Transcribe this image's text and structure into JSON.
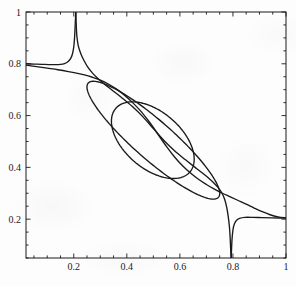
{
  "figure": {
    "background_color": "#fdfdfd",
    "line_color": "#1a1a1a",
    "axis_color": "#1a1a1a"
  },
  "chart_data": {
    "type": "line",
    "title": "",
    "xlabel": "",
    "ylabel": "",
    "xlim": [
      0.02,
      1.0
    ],
    "ylim": [
      0.05,
      1.0
    ],
    "grid": false,
    "legend": null,
    "frame": {
      "left_px": 26,
      "right_px": 286,
      "top_px": 12,
      "bottom_px": 258,
      "box": true,
      "ticks_direction": "in",
      "ticks_on_all_sides": true
    },
    "xticks_major": [
      0.2,
      0.4,
      0.6,
      0.8,
      1.0
    ],
    "xtick_labels": [
      "0.2",
      "0.4",
      "0.6",
      "0.8",
      "1"
    ],
    "xticks_minor_step": 0.05,
    "yticks_major": [
      0.2,
      0.4,
      0.6,
      0.8,
      1.0
    ],
    "ytick_labels": [
      "0.2",
      "0.4",
      "0.6",
      "0.8",
      "1"
    ],
    "yticks_minor_step": 0.05,
    "series": [
      {
        "name": "upper-branch-left",
        "description": "near-horizontal branch entering at left edge near y=0.8, rising into cusp at x=0.205",
        "points": [
          [
            0.02,
            0.8
          ],
          [
            0.05,
            0.799
          ],
          [
            0.08,
            0.798
          ],
          [
            0.105,
            0.797
          ],
          [
            0.13,
            0.797
          ],
          [
            0.15,
            0.798
          ],
          [
            0.165,
            0.801
          ],
          [
            0.178,
            0.808
          ],
          [
            0.188,
            0.82
          ],
          [
            0.195,
            0.838
          ],
          [
            0.2,
            0.865
          ],
          [
            0.203,
            0.9
          ],
          [
            0.205,
            0.94
          ],
          [
            0.2065,
            0.975
          ],
          [
            0.2075,
            1.0
          ]
        ]
      },
      {
        "name": "upper-branch-right",
        "description": "steep descent from top at x=0.208 down through the diagonal",
        "points": [
          [
            0.208,
            1.0
          ],
          [
            0.209,
            0.96
          ],
          [
            0.2105,
            0.925
          ],
          [
            0.2125,
            0.9
          ],
          [
            0.216,
            0.875
          ],
          [
            0.221,
            0.855
          ],
          [
            0.229,
            0.833
          ],
          [
            0.24,
            0.81
          ],
          [
            0.253,
            0.787
          ],
          [
            0.27,
            0.765
          ],
          [
            0.29,
            0.744
          ],
          [
            0.315,
            0.722
          ],
          [
            0.345,
            0.698
          ],
          [
            0.38,
            0.67
          ],
          [
            0.42,
            0.636
          ],
          [
            0.46,
            0.596
          ],
          [
            0.5,
            0.55
          ],
          [
            0.54,
            0.504
          ],
          [
            0.58,
            0.464
          ],
          [
            0.62,
            0.43
          ],
          [
            0.655,
            0.402
          ],
          [
            0.685,
            0.378
          ],
          [
            0.71,
            0.357
          ],
          [
            0.73,
            0.338
          ],
          [
            0.746,
            0.32
          ],
          [
            0.759,
            0.3
          ],
          [
            0.769,
            0.276
          ],
          [
            0.776,
            0.248
          ],
          [
            0.782,
            0.212
          ],
          [
            0.787,
            0.168
          ],
          [
            0.79,
            0.118
          ],
          [
            0.792,
            0.07
          ],
          [
            0.793,
            0.05
          ]
        ]
      },
      {
        "name": "lower-branch-left",
        "description": "diagonal descending curve from left edge near y=0.795 through centre",
        "points": [
          [
            0.02,
            0.795
          ],
          [
            0.06,
            0.789
          ],
          [
            0.1,
            0.783
          ],
          [
            0.14,
            0.777
          ],
          [
            0.18,
            0.77
          ],
          [
            0.21,
            0.764
          ],
          [
            0.24,
            0.757
          ],
          [
            0.27,
            0.748
          ],
          [
            0.3,
            0.737
          ],
          [
            0.33,
            0.722
          ],
          [
            0.36,
            0.703
          ],
          [
            0.39,
            0.68
          ],
          [
            0.42,
            0.652
          ],
          [
            0.45,
            0.62
          ],
          [
            0.48,
            0.582
          ],
          [
            0.5,
            0.554
          ],
          [
            0.52,
            0.524
          ],
          [
            0.55,
            0.48
          ],
          [
            0.58,
            0.44
          ],
          [
            0.61,
            0.406
          ],
          [
            0.64,
            0.378
          ],
          [
            0.67,
            0.354
          ],
          [
            0.7,
            0.334
          ],
          [
            0.73,
            0.316
          ],
          [
            0.76,
            0.3
          ],
          [
            0.79,
            0.286
          ],
          [
            0.82,
            0.272
          ],
          [
            0.85,
            0.258
          ],
          [
            0.88,
            0.243
          ],
          [
            0.91,
            0.229
          ],
          [
            0.94,
            0.217
          ],
          [
            0.97,
            0.209
          ],
          [
            1.0,
            0.205
          ]
        ]
      },
      {
        "name": "lower-branch-right",
        "description": "near-horizontal branch at right edge near y=0.205 falling into cusp at x=0.793",
        "points": [
          [
            0.7935,
            0.05
          ],
          [
            0.795,
            0.09
          ],
          [
            0.797,
            0.128
          ],
          [
            0.8,
            0.158
          ],
          [
            0.805,
            0.18
          ],
          [
            0.813,
            0.195
          ],
          [
            0.825,
            0.203
          ],
          [
            0.845,
            0.207
          ],
          [
            0.875,
            0.207
          ],
          [
            0.91,
            0.206
          ],
          [
            0.95,
            0.205
          ],
          [
            1.0,
            0.204
          ]
        ]
      },
      {
        "name": "outer-ellipse",
        "description": "large elongated lens-shaped ellipse tilted along the descending diagonal",
        "type": "ellipse",
        "center": [
          0.5,
          0.505
        ],
        "semi_major": 0.33,
        "semi_minor": 0.074,
        "rotation_deg": -42
      },
      {
        "name": "inner-ellipse",
        "description": "smaller rounder ellipse tilted along the descending diagonal",
        "type": "ellipse",
        "center": [
          0.498,
          0.505
        ],
        "semi_major": 0.186,
        "semi_minor": 0.108,
        "rotation_deg": -42
      }
    ],
    "annotations": [
      {
        "text": "cusp reaching y=1 at x≈0.206"
      },
      {
        "text": "cusp reaching bottom at x≈0.793"
      },
      {
        "text": "curve crossing near (0.25, 0.75)"
      },
      {
        "text": "curve crossing near (0.75, 0.255)"
      }
    ]
  }
}
